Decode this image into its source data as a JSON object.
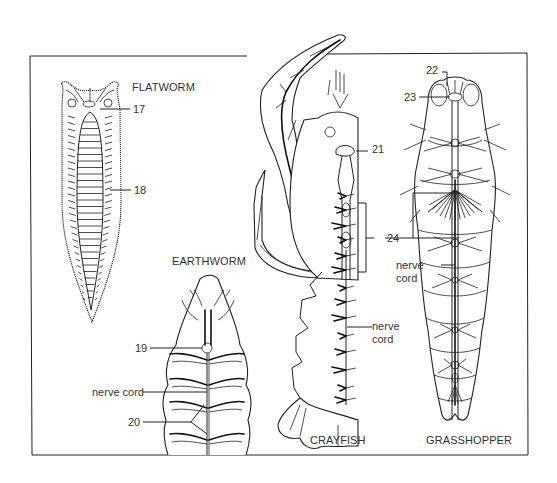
{
  "figure": {
    "organisms": [
      {
        "id": "flatworm",
        "name": "FLATWORM"
      },
      {
        "id": "earthworm",
        "name": "EARTHWORM"
      },
      {
        "id": "crayfish",
        "name": "CRAYFISH"
      },
      {
        "id": "grasshopper",
        "name": "GRASSHOPPER"
      }
    ],
    "labels": {
      "l17": "17",
      "l18": "18",
      "l19": "19",
      "l20": "20",
      "l21": "21",
      "l22": "22",
      "l23": "23",
      "l24": "24",
      "earthworm_nerve_cord": "nerve cord",
      "crayfish_nerve_line1": "nerve",
      "crayfish_nerve_line2": "cord",
      "grasshopper_nerve_line1": "nerve",
      "grasshopper_nerve_line2": "cord"
    }
  }
}
